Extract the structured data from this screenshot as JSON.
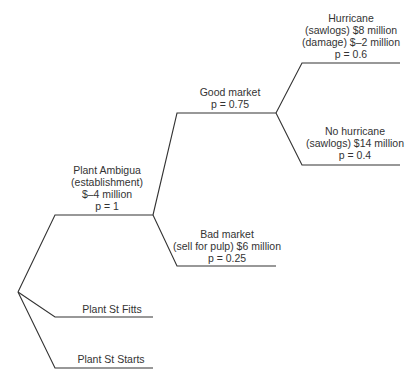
{
  "diagram": {
    "type": "decision-tree",
    "line_color": "#333333",
    "nodes": {
      "root": {
        "x": 18,
        "y": 292
      },
      "ambigua_node": {
        "x": 153,
        "y": 215
      },
      "market_node": {
        "x": 276,
        "y": 113
      }
    },
    "branches": [
      {
        "id": "plant-ambigua",
        "lines": [
          "Plant Ambigua",
          "(establishment)",
          "$–4 million",
          "p = 1"
        ]
      },
      {
        "id": "plant-st-fitts",
        "lines": [
          "Plant St Fitts"
        ]
      },
      {
        "id": "plant-st-starts",
        "lines": [
          "Plant St Starts"
        ]
      },
      {
        "id": "good-market",
        "lines": [
          "Good market",
          "p = 0.75"
        ]
      },
      {
        "id": "bad-market",
        "lines": [
          "Bad market",
          "(sell for pulp) $6 million",
          "p = 0.25"
        ]
      },
      {
        "id": "hurricane",
        "lines": [
          "Hurricane",
          "(sawlogs) $8 million",
          "(damage) $–2 million",
          "p = 0.6"
        ]
      },
      {
        "id": "no-hurricane",
        "lines": [
          "No hurricane",
          "(sawlogs) $14 million",
          "p = 0.4"
        ]
      }
    ]
  }
}
